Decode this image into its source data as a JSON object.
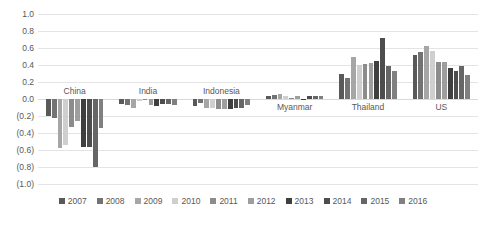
{
  "chart_data": {
    "type": "bar",
    "title": "",
    "xlabel": "",
    "ylabel": "",
    "ylim": [
      -1.0,
      1.0
    ],
    "grid": true,
    "legend_position": "bottom",
    "ytick_labels": [
      "1.0",
      "0.8",
      "0.6",
      "0.4",
      "0.2",
      "0.0",
      "(0.2)",
      "(0.4)",
      "(0.6)",
      "(0.8)",
      "(1.0)"
    ],
    "ytick_values": [
      1.0,
      0.8,
      0.6,
      0.4,
      0.2,
      0.0,
      -0.2,
      -0.4,
      -0.6,
      -0.8,
      -1.0
    ],
    "categories": [
      "China",
      "India",
      "Indonesia",
      "Myanmar",
      "Thailand",
      "US"
    ],
    "series": [
      {
        "name": "2007",
        "color": "#595959",
        "values": [
          -0.2,
          -0.06,
          -0.08,
          0.04,
          0.29,
          0.52
        ]
      },
      {
        "name": "2008",
        "color": "#737373",
        "values": [
          -0.22,
          -0.07,
          -0.05,
          0.05,
          0.25,
          0.55
        ]
      },
      {
        "name": "2009",
        "color": "#a6a6a6",
        "values": [
          -0.58,
          -0.1,
          -0.1,
          0.06,
          0.5,
          0.62
        ]
      },
      {
        "name": "2010",
        "color": "#cfcfcf",
        "values": [
          -0.54,
          -0.02,
          -0.11,
          0.03,
          0.4,
          0.57
        ]
      },
      {
        "name": "2011",
        "color": "#8c8c8c",
        "values": [
          -0.33,
          -0.01,
          -0.12,
          0.01,
          0.41,
          0.44
        ]
      },
      {
        "name": "2012",
        "color": "#9e9e9e",
        "values": [
          -0.26,
          -0.07,
          -0.12,
          0.04,
          0.42,
          0.43
        ]
      },
      {
        "name": "2013",
        "color": "#3f3f3f",
        "values": [
          -0.56,
          -0.08,
          -0.12,
          -0.01,
          0.45,
          0.36
        ]
      },
      {
        "name": "2014",
        "color": "#4d4d4d",
        "values": [
          -0.57,
          -0.06,
          -0.11,
          0.03,
          0.72,
          0.33
        ]
      },
      {
        "name": "2015",
        "color": "#666666",
        "values": [
          -0.8,
          -0.06,
          -0.1,
          0.03,
          0.39,
          0.39
        ]
      },
      {
        "name": "2016",
        "color": "#808080",
        "values": [
          -0.34,
          -0.07,
          -0.07,
          0.03,
          0.33,
          0.28
        ]
      }
    ]
  },
  "legend": {
    "items": [
      "2007",
      "2008",
      "2009",
      "2010",
      "2011",
      "2012",
      "2013",
      "2014",
      "2015",
      "2016"
    ]
  }
}
